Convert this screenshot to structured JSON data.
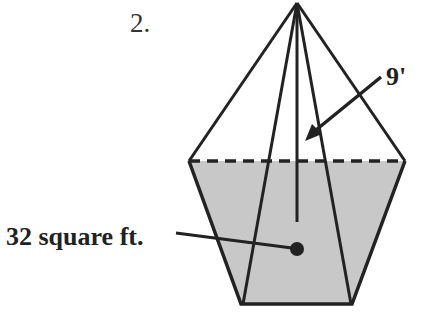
{
  "problem": {
    "number": "2."
  },
  "figure": {
    "type": "pentagonal-pyramid",
    "labels": {
      "slant_height": "9'",
      "base_area": "32 square ft."
    },
    "colors": {
      "stroke": "#222222",
      "base_fill": "#c8c8c8",
      "background": "#ffffff"
    }
  }
}
